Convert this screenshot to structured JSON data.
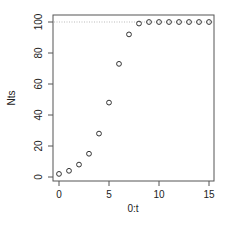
{
  "chart_data": {
    "type": "scatter",
    "title": "",
    "xlabel": "0:t",
    "ylabel": "Nts",
    "x": [
      0,
      1,
      2,
      3,
      4,
      5,
      6,
      7,
      8,
      9,
      10,
      11,
      12,
      13,
      14,
      15
    ],
    "series": [
      {
        "name": "Nts",
        "values": [
          2,
          4,
          8,
          15,
          28,
          48,
          73,
          92,
          99,
          100,
          100,
          100,
          100,
          100,
          100,
          100
        ],
        "marker": "open-circle",
        "color": "#333333"
      }
    ],
    "xlim": [
      0,
      15
    ],
    "ylim": [
      0,
      100
    ],
    "xticks": [
      0,
      5,
      10,
      15
    ],
    "yticks": [
      0,
      20,
      40,
      60,
      80,
      100
    ],
    "reference_lines": [
      {
        "orientation": "horizontal",
        "y": 100,
        "style": "dotted",
        "color": "#bbbbbb"
      }
    ],
    "grid": false,
    "legend": null
  }
}
